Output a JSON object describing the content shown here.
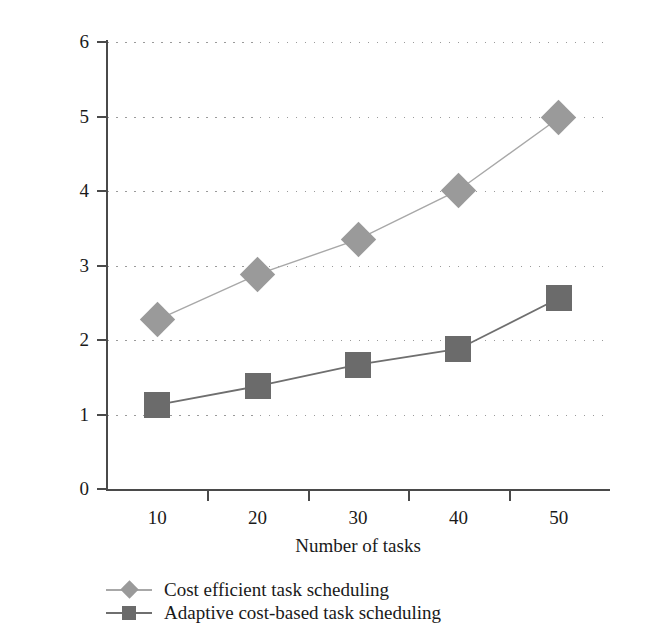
{
  "chart_data": {
    "type": "line",
    "title": "",
    "xlabel": "Number of tasks",
    "ylabel": "Execution time (ms)",
    "categories": [
      10,
      20,
      30,
      40,
      50
    ],
    "x_tick_labels": [
      "10",
      "20",
      "30",
      "40",
      "50"
    ],
    "y_tick_labels": [
      "0",
      "1",
      "2",
      "3",
      "4",
      "5",
      "6"
    ],
    "y_ticks": [
      0,
      1,
      2,
      3,
      4,
      5,
      6
    ],
    "ylim": [
      0,
      6
    ],
    "grid": "horizontal-dotted",
    "legend_position": "below-left",
    "series": [
      {
        "name": "Cost efficient task scheduling",
        "marker": "diamond",
        "color": "#9a9a9a",
        "line_color": "#a8a8a8",
        "values": [
          2.27,
          2.88,
          3.35,
          4.01,
          4.98
        ]
      },
      {
        "name": "Adaptive cost-based task scheduling",
        "marker": "square",
        "color": "#6b6b6b",
        "line_color": "#6f6f6f",
        "values": [
          1.13,
          1.38,
          1.67,
          1.88,
          2.56
        ]
      }
    ]
  },
  "axis": {
    "axis_color": "#4a4a4a",
    "grid_color": "#9a9a9a"
  }
}
